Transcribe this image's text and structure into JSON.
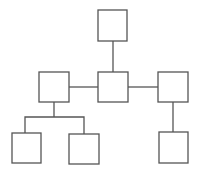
{
  "diagram": {
    "type": "tree",
    "stroke_color": "#555555",
    "background": "#ffffff",
    "nodes": [
      {
        "id": "top",
        "label": "",
        "x": 98,
        "y": 10,
        "w": 29,
        "h": 31
      },
      {
        "id": "center",
        "label": "",
        "x": 98,
        "y": 72,
        "w": 30,
        "h": 30
      },
      {
        "id": "left",
        "label": "",
        "x": 39,
        "y": 72,
        "w": 30,
        "h": 30
      },
      {
        "id": "right",
        "label": "",
        "x": 158,
        "y": 72,
        "w": 30,
        "h": 30
      },
      {
        "id": "left-child-1",
        "label": "",
        "x": 12,
        "y": 133,
        "w": 29,
        "h": 30
      },
      {
        "id": "left-child-2",
        "label": "",
        "x": 69,
        "y": 134,
        "w": 30,
        "h": 30
      },
      {
        "id": "right-child",
        "label": "",
        "x": 159,
        "y": 132,
        "w": 29,
        "h": 31
      }
    ],
    "edges": [
      {
        "from": "top",
        "to": "center"
      },
      {
        "from": "left",
        "to": "center"
      },
      {
        "from": "center",
        "to": "right"
      },
      {
        "from": "left",
        "to": "left-child-1"
      },
      {
        "from": "left",
        "to": "left-child-2"
      },
      {
        "from": "right",
        "to": "right-child"
      }
    ]
  }
}
